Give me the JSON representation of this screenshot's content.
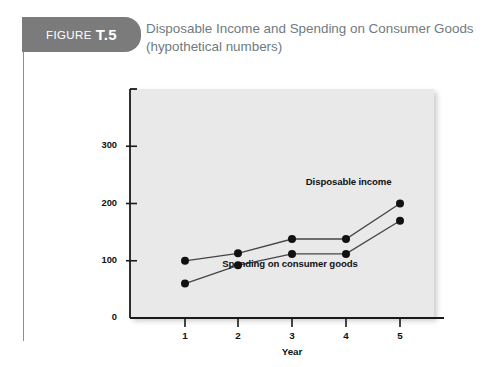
{
  "figure": {
    "badge_word": "FIGURE",
    "badge_number": "T.5",
    "badge_color": "#7b7b7b",
    "title_line1": "Disposable Income and Spending on Consumer Goods",
    "title_line2": "(hypothetical numbers)",
    "title_color": "#6e7b82"
  },
  "chart_data": {
    "type": "line",
    "title": "Disposable Income and Spending on Consumer Goods (hypothetical numbers)",
    "xlabel": "Year",
    "ylabel": "Value ($billion)",
    "x": [
      1,
      2,
      3,
      4,
      5
    ],
    "xtick_labels": [
      "1",
      "2",
      "3",
      "4",
      "5"
    ],
    "ytick_labels": [
      "0",
      "100",
      "200",
      "300"
    ],
    "ytick_values": [
      0,
      100,
      200,
      300
    ],
    "ylim": [
      0,
      400
    ],
    "xlim": [
      0.5,
      5.6
    ],
    "grid": false,
    "legend": "inline-annotations",
    "plot_background": "#e9e9e9",
    "marker": "filled-circle",
    "marker_color": "#111111",
    "line_color": "#444444",
    "series": [
      {
        "name": "Disposable income",
        "values": [
          100,
          113,
          138,
          138,
          200
        ],
        "label_x": 4.05,
        "label_y": 238
      },
      {
        "name": "Spending on consumer goods",
        "values": [
          60,
          92,
          112,
          112,
          170
        ],
        "label_x": 2.95,
        "label_y": 95
      }
    ]
  }
}
